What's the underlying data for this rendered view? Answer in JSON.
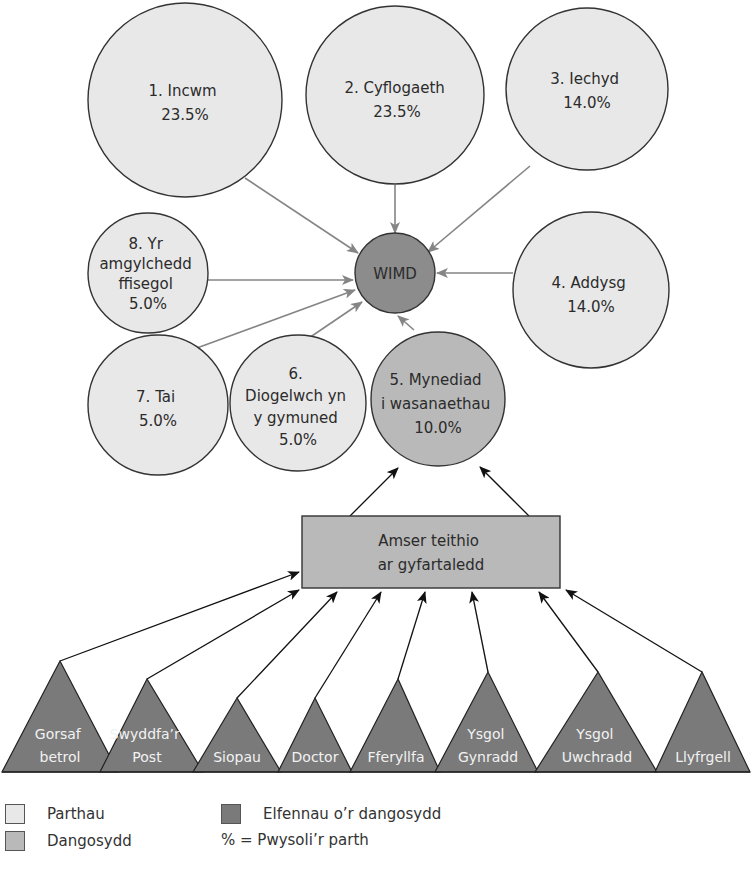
{
  "diagram": {
    "center": {
      "label": "WIMD"
    },
    "domains": [
      {
        "id": 1,
        "lines": [
          "1. Incwm",
          "23.5%"
        ],
        "name": "Incwm",
        "weight": "23.5%"
      },
      {
        "id": 2,
        "lines": [
          "2. Cyflogaeth",
          "23.5%"
        ],
        "name": "Cyflogaeth",
        "weight": "23.5%"
      },
      {
        "id": 3,
        "lines": [
          "3. Iechyd",
          "14.0%"
        ],
        "name": "Iechyd",
        "weight": "14.0%"
      },
      {
        "id": 4,
        "lines": [
          "4. Addysg",
          "14.0%"
        ],
        "name": "Addysg",
        "weight": "14.0%"
      },
      {
        "id": 5,
        "lines": [
          "5. Mynediad",
          "i wasanaethau",
          "10.0%"
        ],
        "name": "Mynediad i wasanaethau",
        "weight": "10.0%"
      },
      {
        "id": 6,
        "lines": [
          "6.",
          "Diogelwch yn",
          "y gymuned",
          "5.0%"
        ],
        "name": "Diogelwch yn y gymuned",
        "weight": "5.0%"
      },
      {
        "id": 7,
        "lines": [
          "7. Tai",
          "5.0%"
        ],
        "name": "Tai",
        "weight": "5.0%"
      },
      {
        "id": 8,
        "lines": [
          "8. Yr",
          "amgylchedd",
          "ffisegol",
          "5.0%"
        ],
        "name": "Yr amgylchedd ffisegol",
        "weight": "5.0%"
      }
    ],
    "indicator": {
      "lines": [
        "Amser teithio",
        "ar gyfartaledd"
      ]
    },
    "elements": [
      {
        "lines": [
          "Gorsaf",
          "betrol"
        ]
      },
      {
        "lines": [
          "Swyddfa’r",
          "Post"
        ]
      },
      {
        "lines": [
          "Siopau"
        ]
      },
      {
        "lines": [
          "Doctor"
        ]
      },
      {
        "lines": [
          "Fferyllfa"
        ]
      },
      {
        "lines": [
          "Ysgol",
          "Gynradd"
        ]
      },
      {
        "lines": [
          "Ysgol",
          "Uwchradd"
        ]
      },
      {
        "lines": [
          "Llyfrgell"
        ]
      }
    ]
  },
  "legend": {
    "domains_label": "Parthau",
    "indicator_label": "Dangosydd",
    "elements_label": "Elfennau o’r dangosydd",
    "weight_note": "% = Pwysoli’r parth"
  },
  "colors": {
    "domain_fill": "#e8e8e8",
    "indicator_fill": "#b9b9b9",
    "element_fill": "#7a7a7a",
    "wimd_fill": "#8c8c8c",
    "outline": "#333333",
    "grey_arrow": "#858585",
    "black_arrow": "#111111"
  }
}
